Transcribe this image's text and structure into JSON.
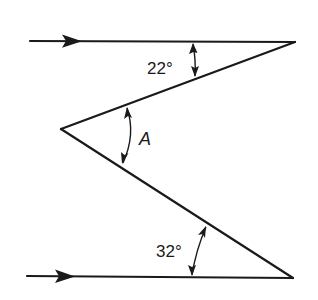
{
  "figure": {
    "angles": {
      "top": {
        "label": "22°",
        "value_deg": 22
      },
      "middle": {
        "label": "A",
        "value_deg": null
      },
      "bottom": {
        "label": "32°",
        "value_deg": 32
      }
    },
    "incoming_rays": [
      {
        "name": "top-incoming-ray",
        "direction": "right"
      },
      {
        "name": "bottom-incoming-ray",
        "direction": "right"
      }
    ],
    "colors": {
      "ink": "#1a1a1a",
      "background": "#ffffff"
    }
  }
}
